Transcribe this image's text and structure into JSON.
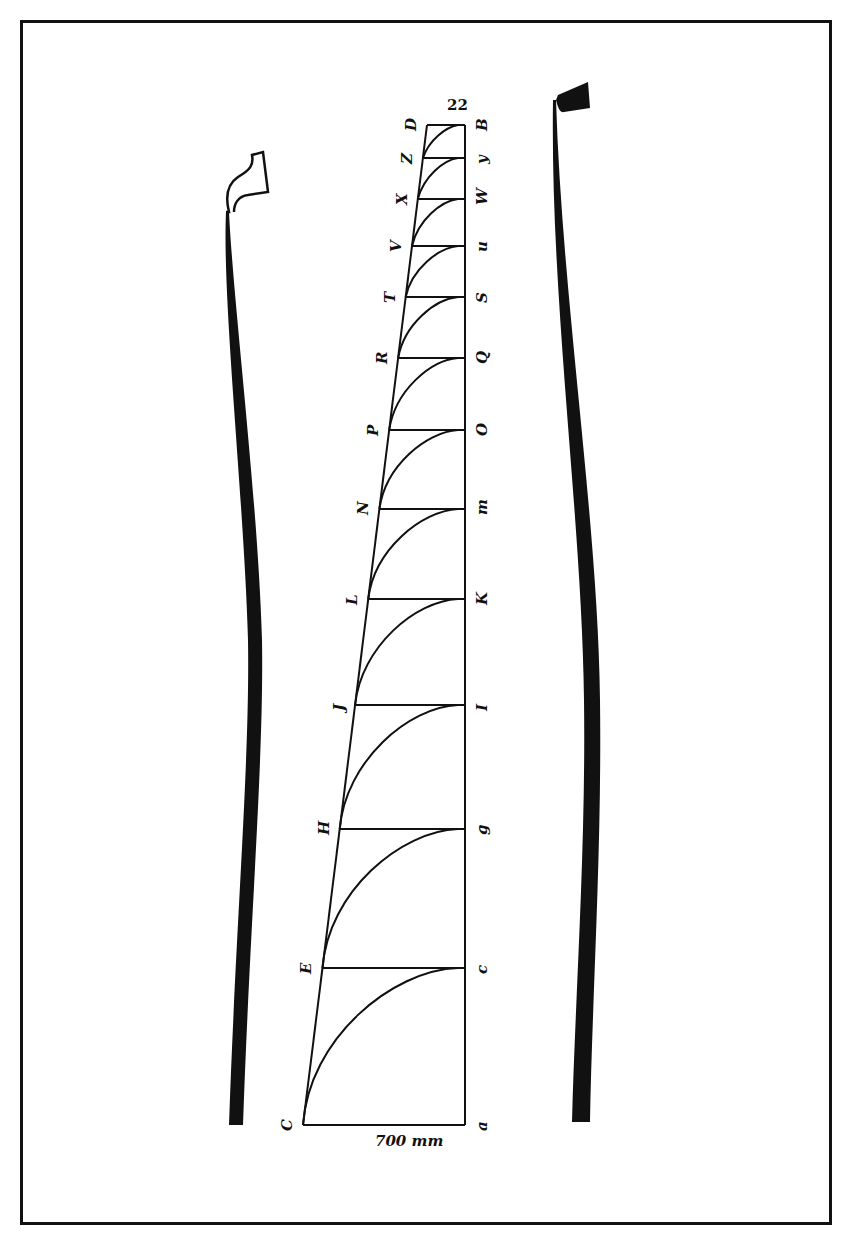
{
  "figure": {
    "top_number": "22",
    "base_length_label": "700 mm",
    "left_column_labels": [
      "D",
      "Z",
      "X",
      "V",
      "T",
      "R",
      "P",
      "N",
      "L",
      "J",
      "H",
      "E",
      "C"
    ],
    "right_column_labels": [
      "B",
      "y",
      "W",
      "u",
      "S",
      "Q",
      "O",
      "m",
      "K",
      "I",
      "g",
      "c",
      "a"
    ],
    "rungs_y": [
      125,
      158,
      199,
      246,
      297,
      358,
      430,
      509,
      599,
      705,
      829,
      968,
      1125
    ],
    "colors": {
      "ink": "#111111",
      "paper": "#ffffff"
    },
    "bows": [
      {
        "name": "left-bow",
        "style": "outline-head"
      },
      {
        "name": "right-bow",
        "style": "solid-head"
      }
    ]
  }
}
